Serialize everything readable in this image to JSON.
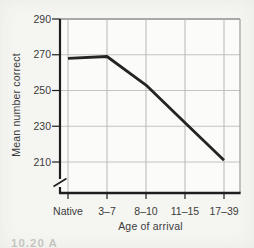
{
  "figure": {
    "caption_fragment": "10.20  A",
    "background": "#f5f5f2"
  },
  "chart_data": {
    "type": "line",
    "title": "",
    "categories": [
      "Native",
      "3–7",
      "8–10",
      "11–15",
      "17–39"
    ],
    "values": [
      268,
      269,
      253,
      232,
      211
    ],
    "series": [
      {
        "name": "Mean number correct by age of arrival",
        "values": [
          268,
          269,
          253,
          232,
          211
        ]
      }
    ],
    "xlabel": "Age of arrival",
    "ylabel": "Mean number correct",
    "y_ticks": [
      290,
      270,
      250,
      230,
      210
    ],
    "ylim": [
      210,
      290
    ],
    "axis_break_below_min": true,
    "grid": true,
    "legend": "none",
    "colors": {
      "line": "#242424",
      "axis": "#1e1e1e",
      "grid_h": "#c3c3c0",
      "grid_v": "#b7b7b4",
      "frame_top": "#8e8e8c",
      "frame_right": "#9c9c99",
      "text": "#3b3b3b",
      "plot_bg": "#fbfbf9"
    }
  }
}
